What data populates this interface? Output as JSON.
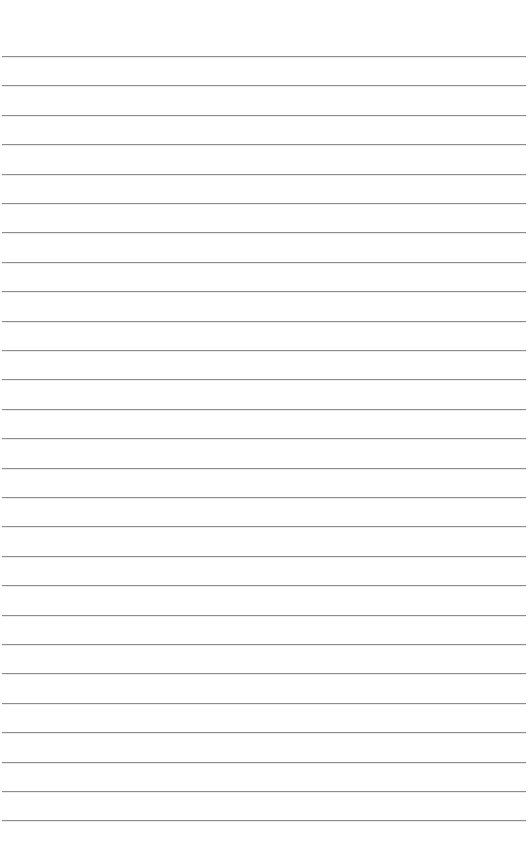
{
  "page": {
    "type": "lined-paper",
    "background_color": "#ffffff",
    "rule_color": "#8c8c8c",
    "rule_count": 27,
    "first_rule_y": 56,
    "rule_spacing": 29.4,
    "rule_left": 2,
    "rule_width": 524,
    "text_lines": []
  }
}
